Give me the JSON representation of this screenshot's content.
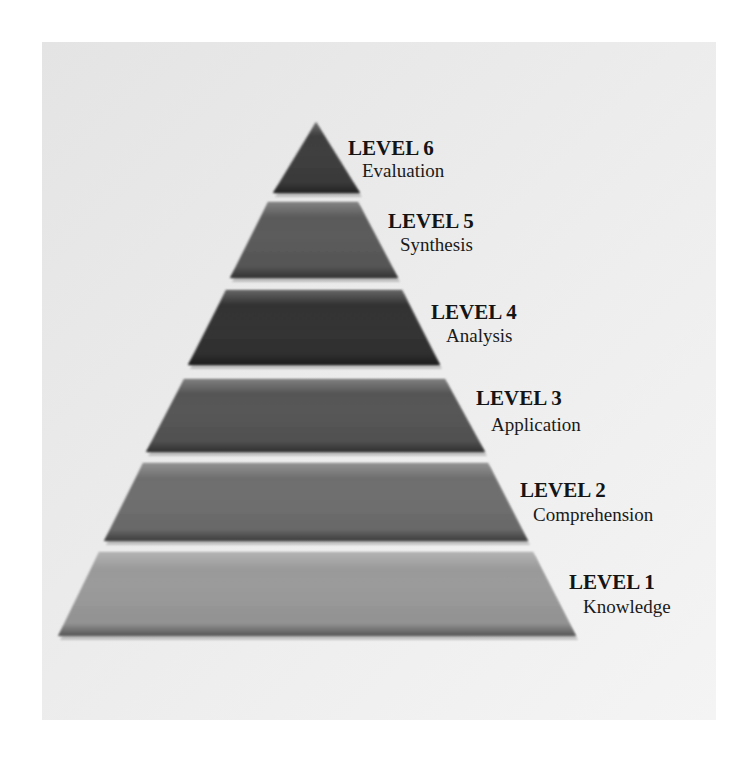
{
  "diagram": {
    "type": "pyramid",
    "levels": [
      {
        "level_label": "LEVEL 6",
        "name": "Evaluation",
        "fill": "#3d3d3d"
      },
      {
        "level_label": "LEVEL 5",
        "name": "Synthesis",
        "fill": "#5a5a5a"
      },
      {
        "level_label": "LEVEL 4",
        "name": "Analysis",
        "fill": "#333333"
      },
      {
        "level_label": "LEVEL 3",
        "name": "Application",
        "fill": "#555555"
      },
      {
        "level_label": "LEVEL 2",
        "name": "Comprehension",
        "fill": "#6e6e6e"
      },
      {
        "level_label": "LEVEL 1",
        "name": "Knowledge",
        "fill": "#9a9a9a"
      }
    ]
  }
}
